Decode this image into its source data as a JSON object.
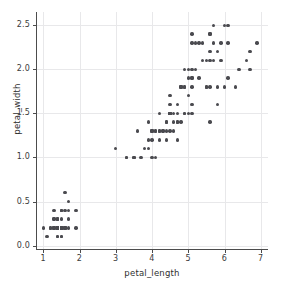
{
  "chart_data": {
    "type": "scatter",
    "title": "",
    "xlabel": "petal_length",
    "ylabel": "petal_width",
    "xlim": [
      0.8,
      7.2
    ],
    "ylim": [
      -0.05,
      2.65
    ],
    "xticks": [
      "1",
      "2",
      "3",
      "4",
      "5",
      "6",
      "7"
    ],
    "xtick_values": [
      1,
      2,
      3,
      4,
      5,
      6,
      7
    ],
    "yticks": [
      "0.0",
      "0.5",
      "1.0",
      "1.5",
      "2.0",
      "2.5"
    ],
    "ytick_values": [
      0.0,
      0.5,
      1.0,
      1.5,
      2.0,
      2.5
    ],
    "grid": true,
    "legend": "none",
    "marker_color": "#4a4a4f",
    "grid_color": "#e8e8ea",
    "axis_color": "#4c4c4c",
    "background": "#ffffff",
    "series": [
      {
        "name": "iris",
        "x": [
          1.4,
          1.4,
          1.3,
          1.5,
          1.4,
          1.7,
          1.4,
          1.5,
          1.4,
          1.5,
          1.5,
          1.6,
          1.4,
          1.1,
          1.2,
          1.5,
          1.3,
          1.4,
          1.7,
          1.5,
          1.7,
          1.5,
          1.0,
          1.7,
          1.9,
          1.6,
          1.6,
          1.5,
          1.4,
          1.6,
          1.6,
          1.5,
          1.5,
          1.4,
          1.5,
          1.2,
          1.3,
          1.4,
          1.3,
          1.5,
          1.3,
          1.3,
          1.3,
          1.6,
          1.9,
          1.4,
          1.6,
          1.4,
          1.5,
          1.4,
          4.7,
          4.5,
          4.9,
          4.0,
          4.6,
          4.5,
          4.7,
          3.3,
          4.6,
          3.9,
          3.5,
          4.2,
          4.0,
          4.7,
          3.6,
          4.4,
          4.5,
          4.1,
          4.5,
          3.9,
          4.8,
          4.0,
          4.9,
          4.7,
          4.3,
          4.4,
          4.8,
          5.0,
          4.5,
          3.5,
          3.8,
          3.7,
          3.9,
          5.1,
          4.5,
          4.5,
          4.7,
          4.4,
          4.1,
          4.0,
          4.4,
          4.6,
          4.0,
          3.3,
          4.2,
          4.2,
          4.2,
          4.3,
          3.0,
          4.1,
          6.0,
          5.1,
          5.9,
          5.6,
          5.8,
          6.6,
          4.5,
          6.3,
          5.8,
          6.1,
          5.1,
          5.3,
          5.5,
          5.0,
          5.1,
          5.3,
          5.5,
          6.7,
          6.9,
          5.0,
          5.7,
          4.9,
          6.7,
          4.9,
          5.7,
          6.0,
          4.8,
          4.9,
          5.6,
          5.8,
          6.1,
          6.4,
          5.6,
          5.1,
          5.6,
          6.1,
          5.6,
          5.5,
          4.8,
          5.4,
          5.6,
          5.1,
          5.1,
          5.9,
          5.7,
          5.2,
          5.0,
          5.2,
          5.4,
          5.1
        ],
        "y": [
          0.2,
          0.2,
          0.2,
          0.2,
          0.2,
          0.4,
          0.3,
          0.2,
          0.2,
          0.1,
          0.2,
          0.2,
          0.1,
          0.1,
          0.2,
          0.4,
          0.4,
          0.3,
          0.3,
          0.3,
          0.2,
          0.4,
          0.2,
          0.5,
          0.2,
          0.2,
          0.4,
          0.2,
          0.2,
          0.2,
          0.2,
          0.4,
          0.1,
          0.2,
          0.2,
          0.2,
          0.2,
          0.1,
          0.2,
          0.2,
          0.3,
          0.3,
          0.2,
          0.6,
          0.4,
          0.3,
          0.2,
          0.2,
          0.2,
          0.2,
          1.4,
          1.5,
          1.5,
          1.3,
          1.5,
          1.3,
          1.6,
          1.0,
          1.3,
          1.4,
          1.0,
          1.5,
          1.0,
          1.4,
          1.3,
          1.4,
          1.5,
          1.0,
          1.5,
          1.1,
          1.8,
          1.3,
          1.5,
          1.2,
          1.3,
          1.4,
          1.4,
          1.7,
          1.5,
          1.0,
          1.1,
          1.0,
          1.2,
          1.6,
          1.5,
          1.6,
          1.5,
          1.3,
          1.3,
          1.3,
          1.2,
          1.4,
          1.2,
          1.0,
          1.3,
          1.2,
          1.3,
          1.3,
          1.1,
          1.3,
          2.5,
          1.9,
          2.1,
          1.8,
          2.2,
          2.1,
          1.7,
          1.8,
          1.8,
          2.5,
          2.0,
          1.9,
          2.1,
          2.0,
          2.4,
          2.3,
          1.8,
          2.2,
          2.3,
          1.5,
          2.3,
          2.0,
          2.0,
          1.8,
          2.1,
          1.8,
          1.8,
          1.8,
          2.1,
          1.6,
          1.9,
          2.0,
          2.2,
          1.5,
          1.4,
          2.3,
          2.4,
          1.8,
          1.8,
          2.1,
          2.4,
          2.3,
          1.9,
          2.3,
          2.5,
          2.3,
          1.9,
          2.0,
          2.3,
          1.8
        ]
      }
    ]
  }
}
